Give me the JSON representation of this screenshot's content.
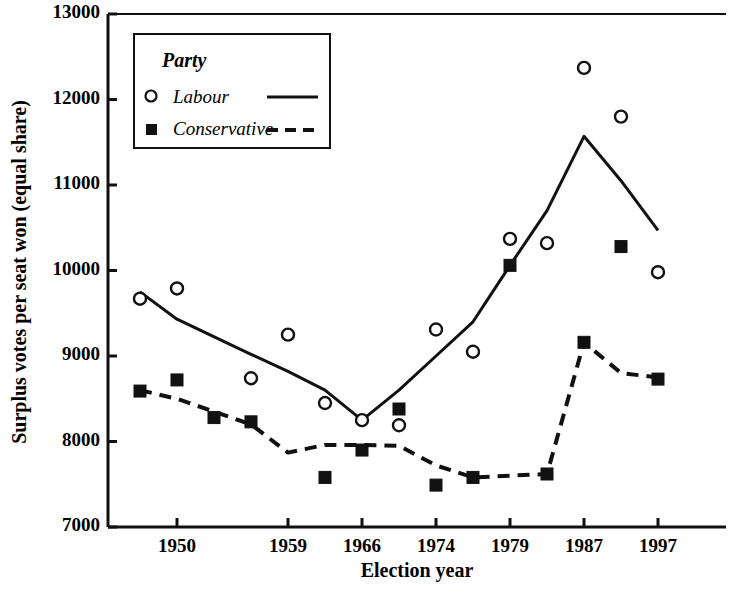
{
  "chart_data": {
    "type": "scatter",
    "title": "",
    "xlabel": "Election year",
    "ylabel": "Surplus votes per seat won (equal share)",
    "ylim": [
      7000,
      13000
    ],
    "ytick_labels": [
      "7000",
      "8000",
      "9000",
      "10000",
      "11000",
      "12000",
      "13000"
    ],
    "ytick_values": [
      7000,
      8000,
      9000,
      10000,
      11000,
      12000,
      13000
    ],
    "xtick_labels": [
      "1950",
      "1959",
      "1966",
      "1974",
      "1979",
      "1987",
      "1997"
    ],
    "x_categories": [
      1945,
      1950,
      1951,
      1955,
      1959,
      1964,
      1966,
      1970,
      1974.1,
      1974.7,
      1979,
      1983,
      1987,
      1992,
      1997
    ],
    "grid": false,
    "legend_position": "top-left",
    "legend_title": "Party",
    "series": [
      {
        "name": "Labour",
        "marker": "open-circle",
        "line_style": "solid",
        "points": [
          {
            "x": 1945,
            "y": 9670
          },
          {
            "x": 1950,
            "y": 9790
          },
          {
            "x": 1955,
            "y": 8740
          },
          {
            "x": 1959,
            "y": 9250
          },
          {
            "x": 1964,
            "y": 8450
          },
          {
            "x": 1966,
            "y": 8250
          },
          {
            "x": 1970,
            "y": 8190
          },
          {
            "x": 1974.1,
            "y": 9310
          },
          {
            "x": 1974.7,
            "y": 9050
          },
          {
            "x": 1979,
            "y": 10370
          },
          {
            "x": 1983,
            "y": 10320
          },
          {
            "x": 1987,
            "y": 12370
          },
          {
            "x": 1992,
            "y": 11800
          },
          {
            "x": 1997,
            "y": 9980
          }
        ],
        "trend": [
          {
            "x": 1945,
            "y": 9750
          },
          {
            "x": 1950,
            "y": 9430
          },
          {
            "x": 1955,
            "y": 9020
          },
          {
            "x": 1959,
            "y": 8820
          },
          {
            "x": 1964,
            "y": 8600
          },
          {
            "x": 1966,
            "y": 8250
          },
          {
            "x": 1970,
            "y": 8600
          },
          {
            "x": 1974.1,
            "y": 9000
          },
          {
            "x": 1974.7,
            "y": 9400
          },
          {
            "x": 1979,
            "y": 10060
          },
          {
            "x": 1983,
            "y": 10700
          },
          {
            "x": 1987,
            "y": 11570
          },
          {
            "x": 1992,
            "y": 11050
          },
          {
            "x": 1997,
            "y": 10470
          }
        ]
      },
      {
        "name": "Conservative",
        "marker": "filled-square",
        "line_style": "dashed",
        "points": [
          {
            "x": 1945,
            "y": 8590
          },
          {
            "x": 1950,
            "y": 8720
          },
          {
            "x": 1951,
            "y": 8280
          },
          {
            "x": 1955,
            "y": 8230
          },
          {
            "x": 1964,
            "y": 7580
          },
          {
            "x": 1966,
            "y": 7900
          },
          {
            "x": 1970,
            "y": 8380
          },
          {
            "x": 1974.1,
            "y": 7490
          },
          {
            "x": 1974.7,
            "y": 7580
          },
          {
            "x": 1979,
            "y": 10060
          },
          {
            "x": 1983,
            "y": 7620
          },
          {
            "x": 1987,
            "y": 9160
          },
          {
            "x": 1992,
            "y": 10280
          },
          {
            "x": 1997,
            "y": 8730
          }
        ],
        "trend": [
          {
            "x": 1945,
            "y": 8600
          },
          {
            "x": 1950,
            "y": 8500
          },
          {
            "x": 1955,
            "y": 8200
          },
          {
            "x": 1959,
            "y": 7870
          },
          {
            "x": 1964,
            "y": 7960
          },
          {
            "x": 1966,
            "y": 7960
          },
          {
            "x": 1970,
            "y": 7950
          },
          {
            "x": 1974.1,
            "y": 7720
          },
          {
            "x": 1974.7,
            "y": 7580
          },
          {
            "x": 1979,
            "y": 7600
          },
          {
            "x": 1983,
            "y": 7620
          },
          {
            "x": 1987,
            "y": 9160
          },
          {
            "x": 1992,
            "y": 8800
          },
          {
            "x": 1997,
            "y": 8750
          }
        ]
      }
    ]
  },
  "legend": {
    "title": "Party",
    "entries": [
      {
        "label": "Labour",
        "marker": "open-circle",
        "line": "solid"
      },
      {
        "label": "Conservative",
        "marker": "filled-square",
        "line": "dashed"
      }
    ]
  },
  "axes": {
    "x_title": "Election year",
    "y_title": "Surplus votes per seat won (equal share)",
    "y_ticks": [
      "13000",
      "12000",
      "11000",
      "10000",
      "9000",
      "8000",
      "7000"
    ],
    "x_ticks": [
      "1950",
      "1959",
      "1966",
      "1974",
      "1979",
      "1987",
      "1997"
    ]
  },
  "colors": {
    "ink": "#111111",
    "background": "#ffffff"
  }
}
